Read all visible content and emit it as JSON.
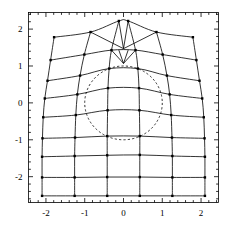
{
  "chart_data": {
    "type": "line",
    "title": "",
    "subtitle": "",
    "xlabel": "",
    "ylabel": "",
    "xlim": [
      -2.45,
      2.45
    ],
    "ylim": [
      -2.7,
      2.45
    ],
    "grid": false,
    "legend": null,
    "legend_position": "none",
    "xticks": [
      -2,
      -1,
      0,
      1,
      2
    ],
    "xtick_labels": [
      "-2",
      "-1",
      "0",
      "1",
      "2"
    ],
    "yticks": [
      -2,
      -1,
      0,
      1,
      2
    ],
    "ytick_labels": [
      "-2",
      "-1",
      "0",
      "1",
      "2"
    ],
    "minor_ticks_per_interval": 5,
    "frame": true,
    "line_color": "#000000",
    "marker_color": "#000000",
    "marker_shape": "square",
    "marker_size_px": 2.4,
    "dashed_circle": {
      "center": [
        0.0,
        0.0
      ],
      "radius": 1.0,
      "style": "dashed",
      "color": "#000000"
    },
    "mesh": {
      "n_radial_lines": 6,
      "n_circumferential_lines": 9,
      "radial_lines": [
        {
          "name": "v=-2.1",
          "points": [
            [
              -2.1,
              -2.52
            ],
            [
              -2.1,
              -2.02
            ],
            [
              -2.1,
              -1.46
            ],
            [
              -2.09,
              -0.96
            ],
            [
              -2.07,
              -0.39
            ],
            [
              -2.03,
              0.12
            ],
            [
              -1.96,
              0.6
            ],
            [
              -1.88,
              1.16
            ],
            [
              -1.79,
              1.78
            ]
          ]
        },
        {
          "name": "v=-1.26",
          "points": [
            [
              -1.26,
              -2.52
            ],
            [
              -1.26,
              -2.02
            ],
            [
              -1.26,
              -1.44
            ],
            [
              -1.25,
              -0.94
            ],
            [
              -1.23,
              -0.33
            ],
            [
              -1.19,
              0.23
            ],
            [
              -1.12,
              0.74
            ],
            [
              -1.01,
              1.31
            ],
            [
              -0.85,
              1.92
            ]
          ]
        },
        {
          "name": "v=-0.42",
          "points": [
            [
              -0.42,
              -2.52
            ],
            [
              -0.42,
              -2.01
            ],
            [
              -0.42,
              -1.42
            ],
            [
              -0.42,
              -0.9
            ],
            [
              -0.41,
              -0.2
            ],
            [
              -0.4,
              0.4
            ],
            [
              -0.37,
              0.93
            ],
            [
              -0.31,
              1.43
            ],
            [
              -0.12,
              2.22
            ]
          ]
        },
        {
          "name": "v=0.42",
          "points": [
            [
              0.42,
              -2.52
            ],
            [
              0.42,
              -2.01
            ],
            [
              0.42,
              -1.41
            ],
            [
              0.42,
              -0.9
            ],
            [
              0.41,
              -0.2
            ],
            [
              0.4,
              0.4
            ],
            [
              0.37,
              0.93
            ],
            [
              0.31,
              1.43
            ],
            [
              0.12,
              2.22
            ]
          ]
        },
        {
          "name": "v=1.26",
          "points": [
            [
              1.26,
              -2.52
            ],
            [
              1.26,
              -2.02
            ],
            [
              1.26,
              -1.44
            ],
            [
              1.25,
              -0.94
            ],
            [
              1.23,
              -0.33
            ],
            [
              1.19,
              0.23
            ],
            [
              1.12,
              0.74
            ],
            [
              1.01,
              1.31
            ],
            [
              0.85,
              1.92
            ]
          ]
        },
        {
          "name": "v=2.10",
          "points": [
            [
              2.1,
              -2.52
            ],
            [
              2.1,
              -2.02
            ],
            [
              2.1,
              -1.46
            ],
            [
              2.09,
              -0.96
            ],
            [
              2.07,
              -0.39
            ],
            [
              2.03,
              0.12
            ],
            [
              1.96,
              0.6
            ],
            [
              1.88,
              1.16
            ],
            [
              1.79,
              1.78
            ]
          ]
        }
      ],
      "circumferential_lines": [
        {
          "name": "u=0",
          "points": [
            [
              -2.1,
              -2.52
            ],
            [
              -1.26,
              -2.52
            ],
            [
              -0.42,
              -2.52
            ],
            [
              0.42,
              -2.52
            ],
            [
              1.26,
              -2.52
            ],
            [
              2.1,
              -2.52
            ]
          ]
        },
        {
          "name": "u=1",
          "points": [
            [
              -2.1,
              -2.02
            ],
            [
              -1.26,
              -2.02
            ],
            [
              -0.42,
              -2.01
            ],
            [
              0.42,
              -2.01
            ],
            [
              1.26,
              -2.02
            ],
            [
              2.1,
              -2.02
            ]
          ]
        },
        {
          "name": "u=2",
          "points": [
            [
              -2.1,
              -1.46
            ],
            [
              -1.26,
              -1.44
            ],
            [
              -0.42,
              -1.42
            ],
            [
              0.42,
              -1.41
            ],
            [
              1.26,
              -1.44
            ],
            [
              2.1,
              -1.46
            ]
          ]
        },
        {
          "name": "u=3",
          "points": [
            [
              -2.09,
              -0.96
            ],
            [
              -1.25,
              -0.94
            ],
            [
              -0.42,
              -0.9
            ],
            [
              0.42,
              -0.9
            ],
            [
              1.25,
              -0.94
            ],
            [
              2.09,
              -0.96
            ]
          ]
        },
        {
          "name": "u=4",
          "points": [
            [
              -2.07,
              -0.39
            ],
            [
              -1.23,
              -0.33
            ],
            [
              -0.41,
              -0.2
            ],
            [
              0.41,
              -0.2
            ],
            [
              1.23,
              -0.33
            ],
            [
              2.07,
              -0.39
            ]
          ]
        },
        {
          "name": "u=5",
          "points": [
            [
              -2.03,
              0.12
            ],
            [
              -1.19,
              0.23
            ],
            [
              -0.4,
              0.4
            ],
            [
              0.4,
              0.4
            ],
            [
              1.19,
              0.23
            ],
            [
              2.03,
              0.12
            ]
          ]
        },
        {
          "name": "u=6",
          "points": [
            [
              -1.96,
              0.6
            ],
            [
              -1.12,
              0.74
            ],
            [
              -0.37,
              0.93
            ],
            [
              0.37,
              0.93
            ],
            [
              1.12,
              0.74
            ],
            [
              1.96,
              0.6
            ]
          ]
        },
        {
          "name": "u=7",
          "points": [
            [
              -1.88,
              1.16
            ],
            [
              -1.01,
              1.31
            ],
            [
              -0.31,
              1.43
            ],
            [
              0.31,
              1.43
            ],
            [
              1.01,
              1.31
            ],
            [
              1.88,
              1.16
            ]
          ]
        },
        {
          "name": "u=8",
          "points": [
            [
              -1.79,
              1.78
            ],
            [
              -0.85,
              1.92
            ],
            [
              -0.12,
              2.22
            ],
            [
              0.12,
              2.22
            ],
            [
              0.85,
              1.92
            ],
            [
              1.79,
              1.78
            ]
          ]
        }
      ]
    }
  }
}
